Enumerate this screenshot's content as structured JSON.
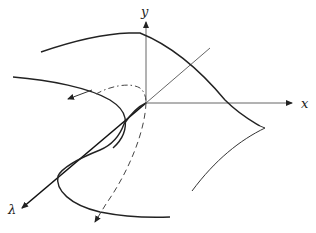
{
  "diagram": {
    "axes": {
      "x_label": "x",
      "y_label": "y",
      "lambda_label": "λ"
    },
    "colors": {
      "ink": "#222222",
      "axis": "#555555",
      "background": "#ffffff"
    },
    "elements": [
      "y-axis (vertical, arrow up)",
      "x-axis (horizontal, arrow right)",
      "λ-axis (diagonal toward lower-left, arrow)",
      "upper surface edge curve",
      "left fold curve with arrow",
      "dash-dot hidden arc",
      "dashed projected curve with arrow",
      "S-shaped cusp curve",
      "lower surface edge curve",
      "right cusp edge"
    ]
  }
}
